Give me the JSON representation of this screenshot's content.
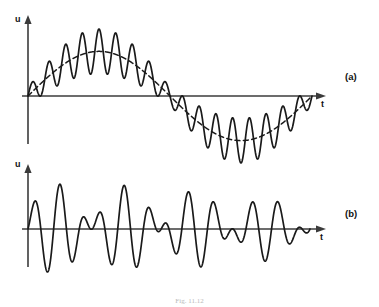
{
  "figure": {
    "caption": "Fig. 11.12",
    "panels": [
      {
        "tag": "(a)",
        "name": "amplitude-modulated-signal-with-carrier",
        "y_axis_label": "u",
        "x_axis_label": "t"
      },
      {
        "tag": "(b)",
        "name": "double-sideband-suppressed-carrier-signal",
        "y_axis_label": "u",
        "x_axis_label": "t"
      }
    ]
  },
  "chart_data": [
    {
      "id": "panel-a",
      "type": "line",
      "title": "",
      "xlabel": "t",
      "ylabel": "u",
      "grid": false,
      "legend": null,
      "xlim": [
        0,
        1
      ],
      "ylim": [
        -1.35,
        1.35
      ],
      "axis_origin_px": {
        "x": 28,
        "y": 96
      },
      "axis_end_px": {
        "x": 326,
        "y": 96
      },
      "series": [
        {
          "name": "modulated-carrier",
          "style": "solid",
          "formula": "(1 + m*sin(2*pi*f_m*t)) scaled envelope plus carrier ripple",
          "carrier_cycles": 17,
          "modulation_cycles": 1,
          "modulation_index": 1.0,
          "envelope_amplitude": 0.72,
          "ripple_amplitude": 0.3,
          "phase_deg": 0
        },
        {
          "name": "modulating-envelope",
          "style": "dashed",
          "formula": "sin(2*pi*f_m*t)",
          "cycles": 1,
          "amplitude": 0.72,
          "phase_deg": 0
        }
      ]
    },
    {
      "id": "panel-b",
      "type": "line",
      "title": "",
      "xlabel": "t",
      "ylabel": "u",
      "grid": false,
      "legend": null,
      "xlim": [
        0,
        1
      ],
      "ylim": [
        -1.25,
        1.25
      ],
      "axis_origin_px": {
        "x": 28,
        "y": 229
      },
      "axis_end_px": {
        "x": 326,
        "y": 229
      },
      "series": [
        {
          "name": "suppressed-carrier-signal",
          "style": "solid",
          "formula": "sin(2*pi*f_m*t) * sin(2*pi*f_c*t)",
          "carrier_cycles": 11,
          "modulation_cycles": 2,
          "amplitude": 1.0,
          "phase_deg": 0
        }
      ]
    }
  ]
}
